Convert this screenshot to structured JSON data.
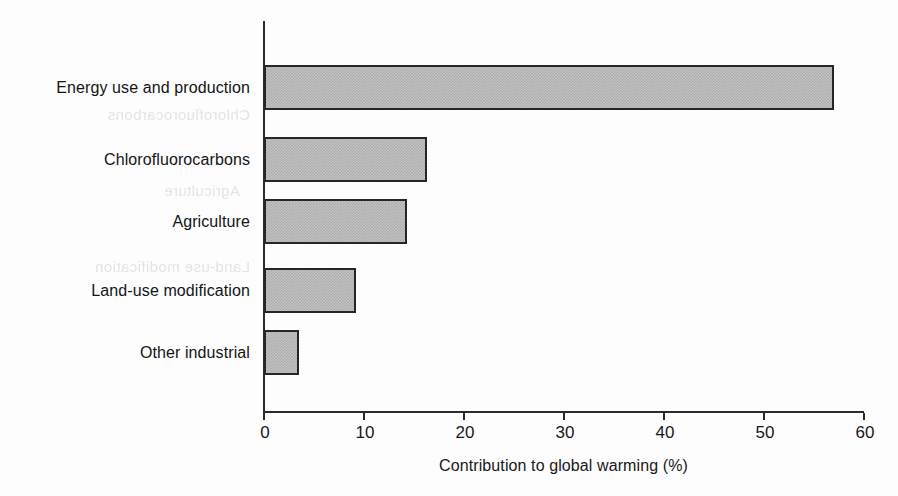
{
  "chart_data": {
    "type": "bar",
    "orientation": "horizontal",
    "title": "",
    "xlabel": "Contribution to global warming (%)",
    "ylabel": "",
    "xlim": [
      0,
      60
    ],
    "xticks": [
      0,
      10,
      20,
      30,
      40,
      50,
      60
    ],
    "xtick_labels": [
      "0",
      "10",
      "20",
      "30",
      "40",
      "50",
      "60"
    ],
    "grid": false,
    "legend": null,
    "categories": [
      "Energy use and production",
      "Chlorofluorocarbons",
      "Agriculture",
      "Land-use modification",
      "Other industrial"
    ],
    "values": [
      57,
      16.3,
      14.3,
      9.2,
      3.5
    ],
    "bar_fill_color": "#c2c2c2",
    "bar_edge_color": "#262626",
    "background_color": "#fdfdfd",
    "axis_color": "#2b2b2b"
  },
  "axis": {
    "title": "Contribution to global warming (%)",
    "ticks": [
      {
        "label": "0",
        "value": 0
      },
      {
        "label": "10",
        "value": 10
      },
      {
        "label": "20",
        "value": 20
      },
      {
        "label": "30",
        "value": 30
      },
      {
        "label": "40",
        "value": 40
      },
      {
        "label": "50",
        "value": 50
      },
      {
        "label": "60",
        "value": 60
      }
    ]
  },
  "bars": [
    {
      "label": "Energy use and production",
      "value": 57
    },
    {
      "label": "Chlorofluorocarbons",
      "value": 16.3
    },
    {
      "label": "Agriculture",
      "value": 14.3
    },
    {
      "label": "Land-use modification",
      "value": 9.2
    },
    {
      "label": "Other industrial",
      "value": 3.5
    }
  ],
  "artifacts": {
    "bleed_through": [
      "Chlorofluorocarbons",
      "Agriculture",
      "Land-use modification"
    ]
  }
}
